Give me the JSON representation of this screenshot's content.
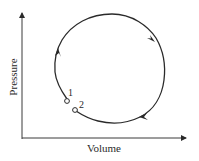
{
  "diagram": {
    "type": "pv-cycle",
    "axes": {
      "x_label": "Volume",
      "y_label": "Pressure"
    },
    "points": [
      {
        "label": "1"
      },
      {
        "label": "2"
      }
    ],
    "cycle_direction": "clockwise",
    "arrows_count": 3,
    "colors": {
      "line": "#2a2a2a",
      "background": "#ffffff"
    }
  }
}
